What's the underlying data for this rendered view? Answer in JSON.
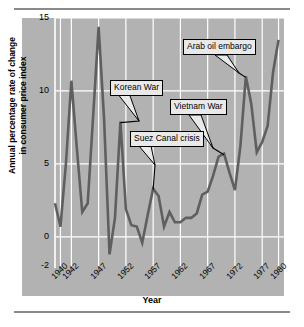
{
  "figure": {
    "panel_bg": "#b2b2b2",
    "line_color": "#5f5f5f",
    "grid_color": "#ffffff",
    "axis_color": "#ffffff",
    "rule_color": "#8a8a8a"
  },
  "chart_data": {
    "type": "line",
    "title": "",
    "xlabel": "Year",
    "ylabel": "Annual percentage rate of change in consumer price index",
    "ylabel_line1": "Annual percentage rate of change",
    "ylabel_line2": "in consumer price index",
    "xlim": [
      1939,
      1981
    ],
    "ylim": [
      -2,
      15
    ],
    "grid": true,
    "legend": "none",
    "ytick_labels": [
      "15",
      "10",
      "5",
      "0",
      "-2"
    ],
    "ytick_values": [
      15,
      10,
      5,
      0,
      -2
    ],
    "xtick_labels": [
      "1940",
      "1942",
      "1947",
      "1952",
      "1957",
      "1962",
      "1967",
      "1972",
      "1977",
      "1980"
    ],
    "xtick_values": [
      1940,
      1942,
      1947,
      1952,
      1957,
      1962,
      1967,
      1972,
      1977,
      1980
    ],
    "x": [
      1939,
      1940,
      1941,
      1942,
      1943,
      1944,
      1945,
      1946,
      1947,
      1948,
      1949,
      1950,
      1951,
      1952,
      1953,
      1954,
      1955,
      1956,
      1957,
      1958,
      1959,
      1960,
      1961,
      1962,
      1963,
      1964,
      1965,
      1966,
      1967,
      1968,
      1969,
      1970,
      1971,
      1972,
      1973,
      1974,
      1975,
      1976,
      1977,
      1978,
      1979,
      1980
    ],
    "values": [
      2.3,
      0.7,
      5.0,
      10.7,
      6.1,
      1.7,
      2.3,
      8.3,
      14.4,
      8.1,
      -1.2,
      1.3,
      7.9,
      1.9,
      0.8,
      0.7,
      -0.4,
      1.5,
      3.3,
      2.8,
      0.7,
      1.7,
      1.0,
      1.0,
      1.3,
      1.3,
      1.6,
      2.9,
      3.1,
      4.2,
      5.5,
      5.7,
      4.4,
      3.2,
      6.2,
      11.0,
      9.1,
      5.8,
      6.5,
      7.6,
      11.3,
      13.5
    ],
    "series_name": "Annual percentage rate of change in consumer price index",
    "annotations": [
      {
        "id": "korean-war",
        "label": "Korean War",
        "point_year": 1951,
        "point_value": 7.9
      },
      {
        "id": "suez-canal-crisis",
        "label": "Suez Canal crisis",
        "point_year": 1957,
        "point_value": 3.3
      },
      {
        "id": "vietnam-war",
        "label": "Vietnam War",
        "point_year": 1970,
        "point_value": 5.7
      },
      {
        "id": "arab-oil-embargo",
        "label": "Arab oil embargo",
        "point_year": 1974,
        "point_value": 11.0
      }
    ]
  }
}
